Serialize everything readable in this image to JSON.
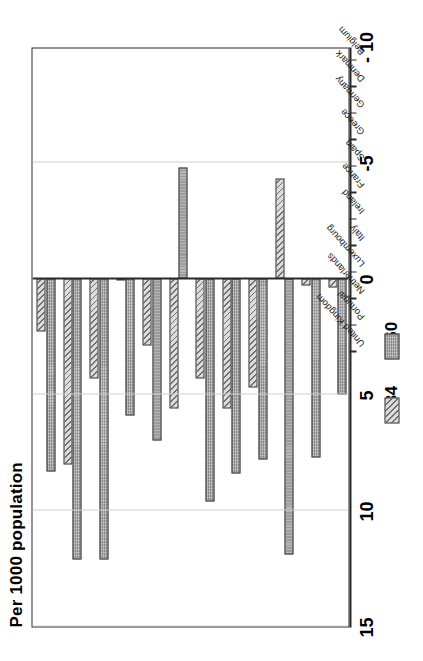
{
  "chart_data": {
    "type": "bar",
    "orientation": "vertical-grouped",
    "title": "Per 1000 population",
    "xlabel": "",
    "ylabel": "Per 1000 population",
    "ylim": [
      -10,
      15
    ],
    "yticks": [
      15,
      10,
      5,
      0,
      -5,
      -10
    ],
    "ytick_labels": [
      "15",
      "10",
      "5",
      "0",
      "-5",
      "- 10"
    ],
    "grid": true,
    "legend_position": "below-right",
    "categories": [
      "Belgium",
      "Denmark",
      "Germany",
      "Greece",
      "Spain",
      "France",
      "Ireland",
      "Italy",
      "Luxembourg",
      "Netherlands",
      "Portugal",
      "United Kingdom"
    ],
    "series": [
      {
        "name": "1960",
        "swatch": "solid-grey",
        "color": "#9a9a9a",
        "values": [
          5.0,
          7.7,
          11.9,
          7.8,
          8.4,
          9.6,
          -4.8,
          7.0,
          5.9,
          12.1,
          12.1,
          8.3
        ]
      },
      {
        "name": "1984",
        "swatch": "hatched",
        "color": "#dcdcdc",
        "values": [
          0.4,
          0.3,
          -4.3,
          4.7,
          5.6,
          4.3,
          5.6,
          2.9,
          0.1,
          4.3,
          8.0,
          2.3
        ]
      }
    ]
  },
  "legend": {
    "entries": [
      {
        "label": "1984"
      },
      {
        "label": "1960"
      }
    ]
  }
}
